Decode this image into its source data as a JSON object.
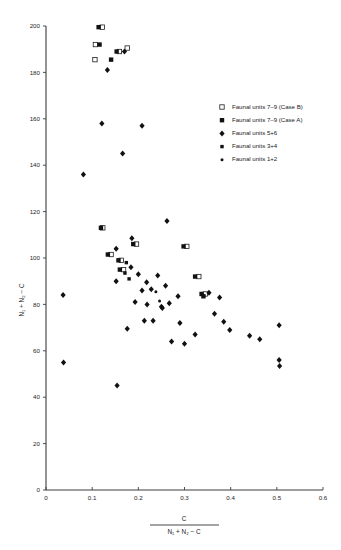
{
  "axes": {
    "x": {
      "label_numerator": "C",
      "label_denominator": "N₁ + N₂ − C",
      "ticks": [
        "0",
        "0.1",
        "0.2",
        "0.3",
        "0.4",
        "0.5",
        "0.6"
      ],
      "min": 0,
      "max": 0.6
    },
    "y": {
      "label": "N₁ + N₂ − C",
      "ticks": [
        "0",
        "20",
        "40",
        "60",
        "80",
        "100",
        "120",
        "140",
        "160",
        "180",
        "200"
      ],
      "min": 0,
      "max": 200
    }
  },
  "legend": {
    "entries": [
      {
        "marker": "open-square",
        "label": "Faunal units 7–9 (Case B)"
      },
      {
        "marker": "filled-square",
        "label": "Faunal units 7–9 (Case A)"
      },
      {
        "marker": "filled-diamond",
        "label": "Faunal units 5+6"
      },
      {
        "marker": "small-filled-square",
        "label": "Faunal units 3+4"
      },
      {
        "marker": "small-dot",
        "label": "Faunal units 1+2"
      }
    ]
  },
  "chart_data": {
    "type": "scatter",
    "title": "",
    "xlabel": "C / (N₁ + N₂ − C)",
    "ylabel": "N₁ + N₂ − C",
    "xlim": [
      0,
      0.6
    ],
    "ylim": [
      0,
      200
    ],
    "grid": false,
    "legend_position": "upper-right",
    "series": [
      {
        "name": "Faunal units 7–9 (Case B)",
        "marker": "open-square",
        "points": [
          [
            0.122,
            199.5
          ],
          [
            0.107,
            192.0
          ],
          [
            0.106,
            185.5
          ],
          [
            0.159,
            189.0
          ],
          [
            0.176,
            190.5
          ],
          [
            0.123,
            113.0
          ],
          [
            0.141,
            101.5
          ],
          [
            0.163,
            99.0
          ],
          [
            0.168,
            95.0
          ],
          [
            0.196,
            106.0
          ],
          [
            0.305,
            105.0
          ],
          [
            0.331,
            92.0
          ],
          [
            0.345,
            84.5
          ]
        ]
      },
      {
        "name": "Faunal units 7–9 (Case A)",
        "marker": "filled-square",
        "points": [
          [
            0.114,
            199.5
          ],
          [
            0.116,
            192.0
          ],
          [
            0.141,
            185.5
          ],
          [
            0.153,
            189.0
          ],
          [
            0.119,
            113.0
          ],
          [
            0.134,
            101.5
          ],
          [
            0.157,
            99.0
          ],
          [
            0.16,
            95.0
          ],
          [
            0.189,
            106.0
          ],
          [
            0.298,
            105.0
          ],
          [
            0.323,
            92.0
          ],
          [
            0.337,
            84.5
          ],
          [
            0.341,
            83.5
          ]
        ]
      },
      {
        "name": "Faunal units 5+6",
        "marker": "filled-diamond",
        "points": [
          [
            0.133,
            181.0
          ],
          [
            0.17,
            189.0
          ],
          [
            0.121,
            158.0
          ],
          [
            0.208,
            157.0
          ],
          [
            0.166,
            145.0
          ],
          [
            0.081,
            136.0
          ],
          [
            0.262,
            116.0
          ],
          [
            0.186,
            108.5
          ],
          [
            0.152,
            104.0
          ],
          [
            0.037,
            84.0
          ],
          [
            0.152,
            90.0
          ],
          [
            0.218,
            89.5
          ],
          [
            0.208,
            86.0
          ],
          [
            0.193,
            81.0
          ],
          [
            0.219,
            80.0
          ],
          [
            0.25,
            79.0
          ],
          [
            0.252,
            78.5
          ],
          [
            0.213,
            73.0
          ],
          [
            0.232,
            73.0
          ],
          [
            0.176,
            69.5
          ],
          [
            0.038,
            55.0
          ],
          [
            0.154,
            45.0
          ],
          [
            0.228,
            86.5
          ],
          [
            0.353,
            85.0
          ],
          [
            0.376,
            83.0
          ],
          [
            0.365,
            76.0
          ],
          [
            0.385,
            72.5
          ],
          [
            0.398,
            69.0
          ],
          [
            0.441,
            66.5
          ],
          [
            0.463,
            65.0
          ],
          [
            0.505,
            71.0
          ],
          [
            0.505,
            56.0
          ],
          [
            0.506,
            53.5
          ],
          [
            0.29,
            72.0
          ],
          [
            0.272,
            64.0
          ],
          [
            0.3,
            63.0
          ],
          [
            0.323,
            67.0
          ],
          [
            0.267,
            80.5
          ],
          [
            0.242,
            92.5
          ],
          [
            0.2,
            93.0
          ],
          [
            0.184,
            96.0
          ],
          [
            0.259,
            88.0
          ],
          [
            0.286,
            83.5
          ]
        ]
      },
      {
        "name": "Faunal units 3+4",
        "marker": "small-filled-square",
        "points": [
          [
            0.174,
            98.0
          ],
          [
            0.171,
            93.5
          ],
          [
            0.18,
            91.0
          ]
        ]
      },
      {
        "name": "Faunal units 1+2",
        "marker": "small-dot",
        "points": [
          [
            0.238,
            85.5
          ],
          [
            0.246,
            81.5
          ]
        ]
      }
    ]
  }
}
